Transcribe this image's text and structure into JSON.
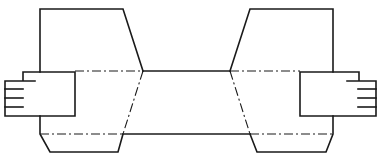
{
  "diagram": {
    "title": "",
    "colors": {
      "line": "#1a1a1a",
      "background": "#ffffff"
    },
    "components": [
      {
        "id": "left-housing",
        "label": ""
      },
      {
        "id": "left-clamp-block",
        "label": ""
      },
      {
        "id": "center-band",
        "label": ""
      },
      {
        "id": "right-housing",
        "label": ""
      },
      {
        "id": "right-clamp-block",
        "label": ""
      }
    ],
    "line_styles": [
      "solid",
      "dash-dot"
    ],
    "clamp_fingers_per_side": 3
  }
}
